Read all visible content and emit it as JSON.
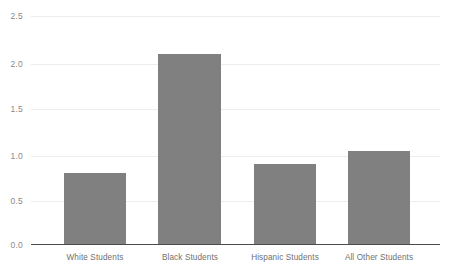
{
  "chart_data": {
    "type": "bar",
    "title": "",
    "subtitle": "",
    "xlabel": "",
    "ylabel": "",
    "categories": [
      "White Students",
      "Black Students",
      "Hispanic Students",
      "All Other Students"
    ],
    "values": [
      0.79,
      2.08,
      0.88,
      1.03
    ],
    "series": [
      {
        "name": "",
        "values": [
          0.79,
          2.08,
          0.88,
          1.03
        ]
      }
    ],
    "ylim": [
      0.0,
      2.5
    ],
    "yticks": [
      0.0,
      0.5,
      1.0,
      1.5,
      2.0,
      2.5
    ],
    "ytick_labels": [
      "0.0",
      "0.5",
      "1.0",
      "1.5",
      "2.0",
      "2.5"
    ],
    "grid": true,
    "grid_axis": "y",
    "legend": false,
    "legend_position": "none",
    "annotations": [],
    "colors": {
      "bar": "#808080",
      "gridline": "#ededed",
      "axis_line": "#4a4a4a",
      "tick_label": "#8a8a8a",
      "category_label": "#707070",
      "background": "#ffffff"
    }
  }
}
